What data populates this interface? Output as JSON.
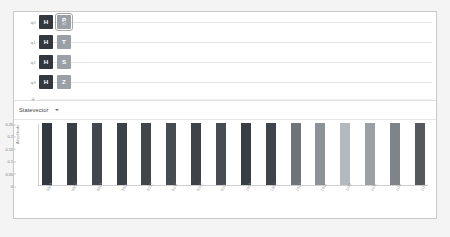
{
  "app": {
    "background": "#f4f4f4",
    "panel_border": "#c9c9c9"
  },
  "circuit": {
    "wires": [
      {
        "label": "q",
        "index": "0",
        "gates": [
          {
            "name": "h-gate",
            "label": "H",
            "sub": "",
            "kind": "h",
            "selected": false
          },
          {
            "name": "p-gate",
            "label": "P",
            "sub": "π/2",
            "kind": "phase",
            "selected": true
          }
        ]
      },
      {
        "label": "q",
        "index": "1",
        "gates": [
          {
            "name": "h-gate",
            "label": "H",
            "sub": "",
            "kind": "h",
            "selected": false
          },
          {
            "name": "t-gate",
            "label": "T",
            "sub": "",
            "kind": "phase",
            "selected": false
          }
        ]
      },
      {
        "label": "q",
        "index": "2",
        "gates": [
          {
            "name": "h-gate",
            "label": "H",
            "sub": "",
            "kind": "h",
            "selected": false
          },
          {
            "name": "s-gate",
            "label": "S",
            "sub": "",
            "kind": "phase",
            "selected": false
          }
        ]
      },
      {
        "label": "q",
        "index": "3",
        "gates": [
          {
            "name": "h-gate",
            "label": "H",
            "sub": "",
            "kind": "h",
            "selected": false
          },
          {
            "name": "z-gate",
            "label": "Z",
            "sub": "",
            "kind": "phase",
            "selected": false
          }
        ]
      }
    ],
    "add_wire_label": "+",
    "gate_colors": {
      "h": "#33383e",
      "phase": "#9aa0a6"
    }
  },
  "selector": {
    "label": "Statevector",
    "chevron": "chevron-down-icon"
  },
  "chart_data": {
    "type": "bar",
    "title": "",
    "xlabel": "",
    "ylabel": "Amplitude",
    "ylim": [
      0,
      0.25
    ],
    "yticks": [
      0,
      0.05,
      0.1,
      0.15,
      0.2,
      0.25
    ],
    "ytick_labels": [
      "0",
      "0.05",
      "0.1",
      "0.15",
      "0.2",
      "0.25"
    ],
    "grid": false,
    "categories": [
      "0000",
      "0001",
      "0010",
      "0011",
      "0100",
      "0101",
      "0110",
      "0111",
      "1000",
      "1001",
      "1010",
      "1011",
      "1100",
      "1101",
      "1110",
      "1111"
    ],
    "values": [
      0.25,
      0.25,
      0.25,
      0.25,
      0.25,
      0.25,
      0.25,
      0.25,
      0.25,
      0.25,
      0.25,
      0.25,
      0.25,
      0.25,
      0.25,
      0.25
    ],
    "bar_colors": [
      "#33383e",
      "#3a3f45",
      "#42474d",
      "#3c4147",
      "#41464c",
      "#474c52",
      "#3e4349",
      "#474c52",
      "#393e44",
      "#3f444a",
      "#6f7479",
      "#8d9297",
      "#b4b9be",
      "#9aa0a5",
      "#7f8489",
      "#55595e"
    ]
  }
}
